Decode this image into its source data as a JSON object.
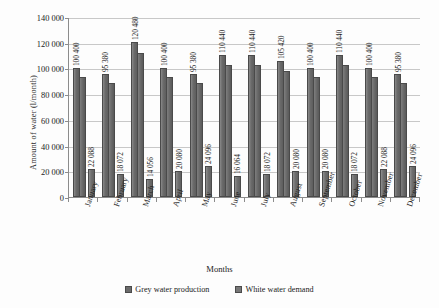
{
  "chart_data": {
    "type": "bar",
    "title": "",
    "xlabel": "Months",
    "ylabel": "Amount of water (l/month)",
    "ylim": [
      0,
      140000
    ],
    "yticks": [
      "0",
      "20 000",
      "40 000",
      "60 000",
      "80 000",
      "100 000",
      "120 000",
      "140 000"
    ],
    "ytick_values": [
      0,
      20000,
      40000,
      60000,
      80000,
      100000,
      120000,
      140000
    ],
    "grid": true,
    "legend_position": "bottom",
    "categories": [
      "January",
      "February",
      "March",
      "April",
      "May",
      "June",
      "July",
      "August",
      "September",
      "October",
      "November",
      "December"
    ],
    "series": [
      {
        "name": "Grey water production",
        "values": [
          100400,
          95380,
          120480,
          100400,
          95380,
          110440,
          110440,
          105420,
          100400,
          110440,
          100400,
          95380
        ],
        "labels": [
          "100 400",
          "95 380",
          "120 480",
          "100 400",
          "95 380",
          "110 440",
          "110 440",
          "105 420",
          "100 400",
          "110 440",
          "100 400",
          "95 380"
        ]
      },
      {
        "name": "White water demand",
        "values": [
          22088,
          18072,
          14056,
          20080,
          24096,
          16064,
          18072,
          20080,
          20080,
          18072,
          22088,
          24096
        ],
        "labels": [
          "22 088",
          "18 072",
          "14 056",
          "20 080",
          "24 096",
          "16 064",
          "18 072",
          "20 080",
          "20 080",
          "18 072",
          "22 088",
          "24 096"
        ]
      }
    ]
  },
  "legend": {
    "items": [
      {
        "label": "Grey water production"
      },
      {
        "label": "White water demand"
      }
    ]
  }
}
